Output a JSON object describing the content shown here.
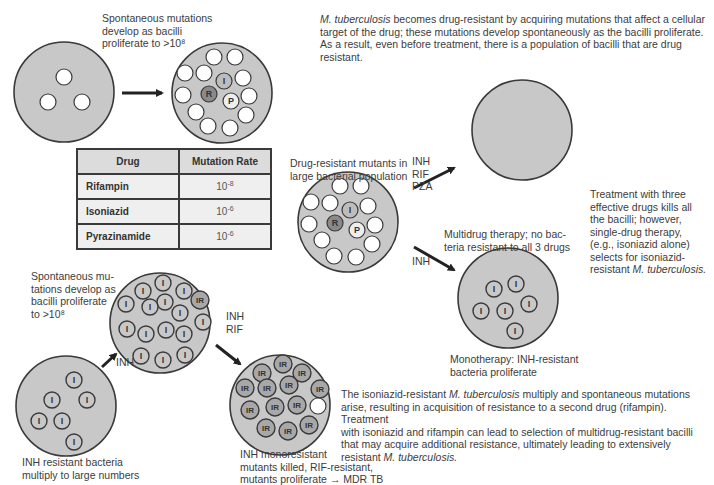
{
  "top_left": {
    "caption": [
      "Spontaneous mutations",
      "develop as bacilli",
      "proliferate to >10⁸"
    ]
  },
  "intro_text": {
    "italic_lead": "M. tuberculosis",
    "line1_rest": " becomes drug-resistant by acquiring mutations that affect a cellular",
    "line2": "target of the drug; these mutations develop spontaneously as the bacilli proliferate.",
    "line3": "As a result, even before treatment, there is a population of bacilli that are drug",
    "line4": "resistant."
  },
  "table": {
    "headers": [
      "Drug",
      "Mutation Rate"
    ],
    "rows": [
      {
        "drug": "Rifampin",
        "rate_base": "10",
        "rate_exp": "-8"
      },
      {
        "drug": "Isoniazid",
        "rate_base": "10",
        "rate_exp": "-6"
      },
      {
        "drug": "Pyrazinamide",
        "rate_base": "10",
        "rate_exp": "-6"
      }
    ]
  },
  "middle": {
    "population_caption": [
      "Drug-resistant mutants in",
      "large bacterial population"
    ],
    "multidrug_label": [
      "INH",
      "RIF",
      "PZA"
    ],
    "multidrug_caption": [
      "Multidrug therapy; no bac-",
      "teria resistant to all 3 drugs"
    ],
    "mono_label": "INH",
    "mono_caption": [
      "Monotherapy: INH-resistant",
      "bacteria proliferate"
    ]
  },
  "right_text": {
    "lines": [
      "Treatment with three",
      "effective drugs kills all",
      "the bacilli; however,",
      "single-drug therapy,",
      "(e.g., isoniazid alone)",
      "selects for isoniazid-"
    ],
    "last_plain": "resistant ",
    "last_italic": "M. tuberculosis."
  },
  "bottom_left": {
    "caption_top": [
      "Spontaneous mu-",
      "tations develop as",
      "bacilli proliferate",
      "to >10⁸"
    ],
    "arrow1_label": "INH",
    "arrow2_label": [
      "INH",
      "RIF"
    ],
    "caption_bottom": [
      "INH resistant bacteria",
      "multiply to large numbers"
    ],
    "mdr_caption": [
      "INH monoresistant",
      "mutants killed, RIF-resistant,",
      "mutants proliferate → MDR TB"
    ]
  },
  "bottom_text": {
    "l1_a": "The isoniazid-resistant ",
    "l1_i": "M. tuberculosis",
    "l1_b": " multiply and spontaneous mutations",
    "l2": "arise, resulting in acquisition of resistance to a second drug (rifampin). Treatment",
    "l3": "with isoniazid and rifampin can lead to selection of multidrug-resistant bacilli",
    "l4": "that may acquire additional resistance, ultimately leading to extensively",
    "l5_a": "resistant ",
    "l5_i": "M. tuberculosis."
  },
  "cell_labels": {
    "I": "I",
    "R": "R",
    "P": "P",
    "IR": "IR"
  },
  "colors": {
    "circle_fill": "#c8c8c8",
    "circle_stroke": "#3a3a3a",
    "cell_white": "#ffffff",
    "R_fill": "#8a8a8a",
    "P_fill": "#eeeeee"
  }
}
